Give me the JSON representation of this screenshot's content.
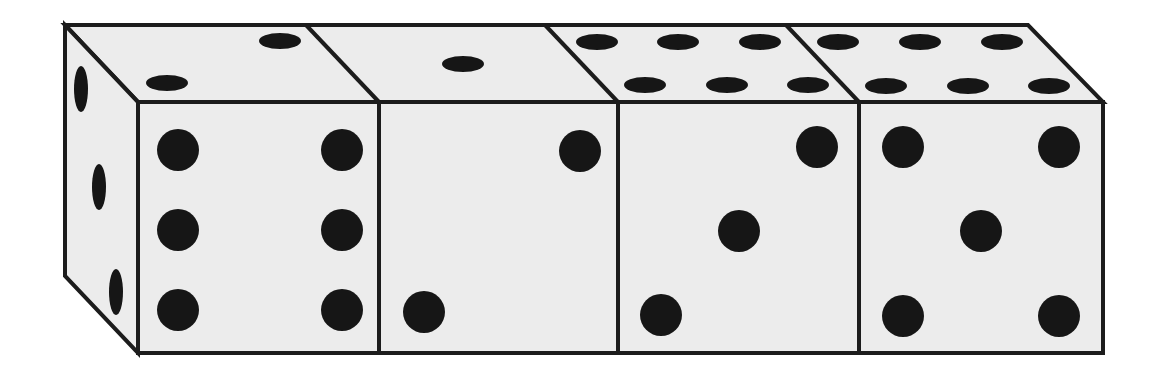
{
  "diagram": {
    "title": "Four dice in a row",
    "colors": {
      "face": "#ececec",
      "outline": "#1c1c1c",
      "pip": "#161616",
      "background": "#ffffff"
    },
    "dice": [
      {
        "index": 1,
        "front_value": 6,
        "top_value": 2,
        "left_side_value": 3
      },
      {
        "index": 2,
        "front_value": 2,
        "top_value": 1
      },
      {
        "index": 3,
        "front_value": 3,
        "top_value": 6
      },
      {
        "index": 4,
        "front_value": 5,
        "top_value": 6
      }
    ]
  }
}
